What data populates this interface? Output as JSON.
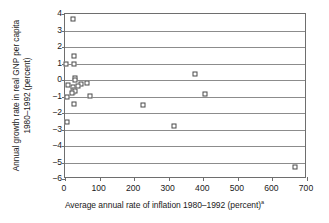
{
  "chart_data": {
    "type": "scatter",
    "title": "",
    "xlabel": "Average annual rate of inflation 1980–1992 (percent)",
    "xlabel_footnote": "a",
    "ylabel_line1": "Annual growth rate in real GNP per capita",
    "ylabel_line2": "1980–1992 (percent)",
    "xlim": [
      0,
      700
    ],
    "ylim": [
      -6,
      4
    ],
    "xticks": [
      0,
      100,
      200,
      300,
      400,
      500,
      600,
      700
    ],
    "yticks": [
      4,
      3,
      2,
      1,
      0,
      -1,
      -2,
      -3,
      -4,
      -5,
      -6
    ],
    "ytick_labels": [
      "4",
      "3",
      "2",
      "1",
      "0",
      "−1",
      "−2",
      "−3",
      "−4",
      "−5",
      "−6"
    ],
    "xtick_labels": [
      "0",
      "100",
      "200",
      "300",
      "400",
      "500",
      "600",
      "700"
    ],
    "grid": "horizontal",
    "gridlines_y": [
      3,
      2,
      1,
      0,
      -1,
      -2,
      -3,
      -4,
      -5
    ],
    "legend": "none",
    "marker": "open-square",
    "marker_color": "#4a4a4a",
    "points": [
      {
        "x": 22,
        "y": 3.7
      },
      {
        "x": 25,
        "y": 1.45
      },
      {
        "x": 3,
        "y": 1.0
      },
      {
        "x": 27,
        "y": 0.95
      },
      {
        "x": 28,
        "y": 0.15
      },
      {
        "x": 29,
        "y": 0.0
      },
      {
        "x": 10,
        "y": -0.3
      },
      {
        "x": 47,
        "y": -0.25
      },
      {
        "x": 23,
        "y": -0.45
      },
      {
        "x": 38,
        "y": -0.35
      },
      {
        "x": 26,
        "y": -0.6
      },
      {
        "x": 24,
        "y": -0.72
      },
      {
        "x": 30,
        "y": -0.68
      },
      {
        "x": 20,
        "y": -0.78
      },
      {
        "x": 65,
        "y": -0.2
      },
      {
        "x": 5,
        "y": -1.05
      },
      {
        "x": 27,
        "y": -1.45
      },
      {
        "x": 72,
        "y": -0.95
      },
      {
        "x": 6,
        "y": -2.55
      },
      {
        "x": 225,
        "y": -1.5
      },
      {
        "x": 315,
        "y": -2.8
      },
      {
        "x": 375,
        "y": 0.35
      },
      {
        "x": 405,
        "y": -0.85
      },
      {
        "x": 665,
        "y": -5.3
      }
    ]
  }
}
